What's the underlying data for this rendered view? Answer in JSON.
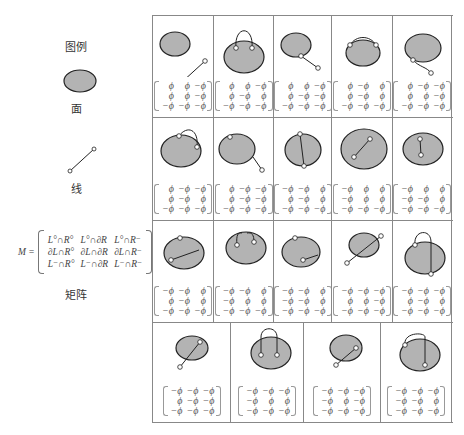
{
  "legend": {
    "title": "图例",
    "face_label": "面",
    "line_label": "线",
    "matrix_label": "矩阵",
    "matrix_lhs": "M =",
    "matrix_entries": [
      [
        "L°∩R°",
        "L°∩∂R",
        "L°∩R⁻"
      ],
      [
        "∂L∩R°",
        "∂L∩∂R",
        "∂L∩R⁻"
      ],
      [
        "L⁻∩R°",
        "L⁻∩∂R",
        "L⁻∩R⁻"
      ]
    ]
  },
  "colors": {
    "face_fill": "#b3b3b3",
    "stroke": "#222222",
    "grid": "#888888"
  },
  "relations": [
    {
      "shape": "disjoint",
      "matrix": [
        [
          "ϕ",
          "ϕ",
          "−ϕ"
        ],
        [
          "ϕ",
          "ϕ",
          "−ϕ"
        ],
        [
          "−ϕ",
          "−ϕ",
          "−ϕ"
        ]
      ]
    },
    {
      "shape": "both-ends-touch-top-outside-arc",
      "matrix": [
        [
          "ϕ",
          "ϕ",
          "−ϕ"
        ],
        [
          "ϕ",
          "−ϕ",
          "ϕ"
        ],
        [
          "−ϕ",
          "−ϕ",
          "−ϕ"
        ]
      ]
    },
    {
      "shape": "one-end-touch-boundary-outside",
      "matrix": [
        [
          "ϕ",
          "ϕ",
          "−ϕ"
        ],
        [
          "ϕ",
          "−ϕ",
          "−ϕ"
        ],
        [
          "−ϕ",
          "−ϕ",
          "−ϕ"
        ]
      ]
    },
    {
      "shape": "arc-along-boundary-ends-on-boundary",
      "matrix": [
        [
          "ϕ",
          "−ϕ",
          "ϕ"
        ],
        [
          "ϕ",
          "−ϕ",
          "ϕ"
        ],
        [
          "−ϕ",
          "−ϕ",
          "−ϕ"
        ]
      ]
    },
    {
      "shape": "arc-outside-ends-on-boundary-below",
      "matrix": [
        [
          "ϕ",
          "−ϕ",
          "−ϕ"
        ],
        [
          "ϕ",
          "ϕ",
          "−ϕ"
        ],
        [
          "−ϕ",
          "−ϕ",
          "−ϕ"
        ]
      ]
    },
    {
      "shape": "outside-arc-ends-on-boundary-side",
      "matrix": [
        [
          "ϕ",
          "−ϕ",
          "−ϕ"
        ],
        [
          "ϕ",
          "−ϕ",
          "ϕ"
        ],
        [
          "−ϕ",
          "−ϕ",
          "−ϕ"
        ]
      ]
    },
    {
      "shape": "boundary-segment-then-outside-tail",
      "matrix": [
        [
          "ϕ",
          "−ϕ",
          "−ϕ"
        ],
        [
          "ϕ",
          "−ϕ",
          "−ϕ"
        ],
        [
          "−ϕ",
          "−ϕ",
          "−ϕ"
        ]
      ]
    },
    {
      "shape": "chord-across-face",
      "matrix": [
        [
          "−ϕ",
          "−ϕ",
          "ϕ"
        ],
        [
          "ϕ",
          "−ϕ",
          "ϕ"
        ],
        [
          "−ϕ",
          "−ϕ",
          "−ϕ"
        ]
      ]
    },
    {
      "shape": "inside-face",
      "matrix": [
        [
          "−ϕ",
          "ϕ",
          "ϕ"
        ],
        [
          "−ϕ",
          "ϕ",
          "ϕ"
        ],
        [
          "−ϕ",
          "−ϕ",
          "−ϕ"
        ]
      ]
    },
    {
      "shape": "boundary-to-interior",
      "matrix": [
        [
          "−ϕ",
          "ϕ",
          "ϕ"
        ],
        [
          "−ϕ",
          "−ϕ",
          "ϕ"
        ],
        [
          "−ϕ",
          "−ϕ",
          "−ϕ"
        ]
      ]
    },
    {
      "shape": "chord-with-boundary-point",
      "matrix": [
        [
          "−ϕ",
          "−ϕ",
          "ϕ"
        ],
        [
          "ϕ",
          "−ϕ",
          "ϕ"
        ],
        [
          "−ϕ",
          "−ϕ",
          "−ϕ"
        ]
      ]
    },
    {
      "shape": "interior-arc-inside",
      "matrix": [
        [
          "−ϕ",
          "−ϕ",
          "ϕ"
        ],
        [
          "−ϕ",
          "ϕ",
          "ϕ"
        ],
        [
          "−ϕ",
          "−ϕ",
          "−ϕ"
        ]
      ]
    },
    {
      "shape": "boundary-point-to-interior-segment",
      "matrix": [
        [
          "−ϕ",
          "−ϕ",
          "ϕ"
        ],
        [
          "−ϕ",
          "−ϕ",
          "ϕ"
        ],
        [
          "−ϕ",
          "−ϕ",
          "−ϕ"
        ]
      ]
    },
    {
      "shape": "crossing-both-ends-outside",
      "matrix": [
        [
          "−ϕ",
          "−ϕ",
          "−ϕ"
        ],
        [
          "ϕ",
          "ϕ",
          "−ϕ"
        ],
        [
          "−ϕ",
          "−ϕ",
          "−ϕ"
        ]
      ]
    },
    {
      "shape": "outside-arc-through-interior",
      "matrix": [
        [
          "−ϕ",
          "−ϕ",
          "−ϕ"
        ],
        [
          "ϕ",
          "−ϕ",
          "ϕ"
        ],
        [
          "−ϕ",
          "−ϕ",
          "−ϕ"
        ]
      ]
    },
    {
      "shape": "crossing-one-end-outside-one-on-boundary",
      "matrix": [
        [
          "−ϕ",
          "−ϕ",
          "−ϕ"
        ],
        [
          "ϕ",
          "−ϕ",
          "−ϕ"
        ],
        [
          "−ϕ",
          "−ϕ",
          "−ϕ"
        ]
      ]
    },
    {
      "shape": "both-ends-inside-arc-outside",
      "matrix": [
        [
          "−ϕ",
          "−ϕ",
          "−ϕ"
        ],
        [
          "−ϕ",
          "ϕ",
          "ϕ"
        ],
        [
          "−ϕ",
          "−ϕ",
          "−ϕ"
        ]
      ]
    },
    {
      "shape": "one-end-inside-one-outside",
      "matrix": [
        [
          "−ϕ",
          "−ϕ",
          "−ϕ"
        ],
        [
          "−ϕ",
          "ϕ",
          "−ϕ"
        ],
        [
          "−ϕ",
          "−ϕ",
          "−ϕ"
        ]
      ]
    },
    {
      "shape": "boundary-arc-outside-to-interior",
      "matrix": [
        [
          "−ϕ",
          "−ϕ",
          "−ϕ"
        ],
        [
          "−ϕ",
          "−ϕ",
          "ϕ"
        ],
        [
          "−ϕ",
          "−ϕ",
          "−ϕ"
        ]
      ]
    }
  ]
}
